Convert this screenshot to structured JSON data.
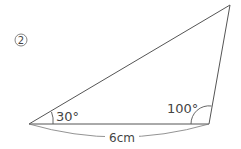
{
  "problem_number": "2",
  "angles": {
    "left": "30°",
    "right": "100°"
  },
  "base_length": "6cm",
  "colors": {
    "stroke": "#555555",
    "text": "#444444"
  }
}
